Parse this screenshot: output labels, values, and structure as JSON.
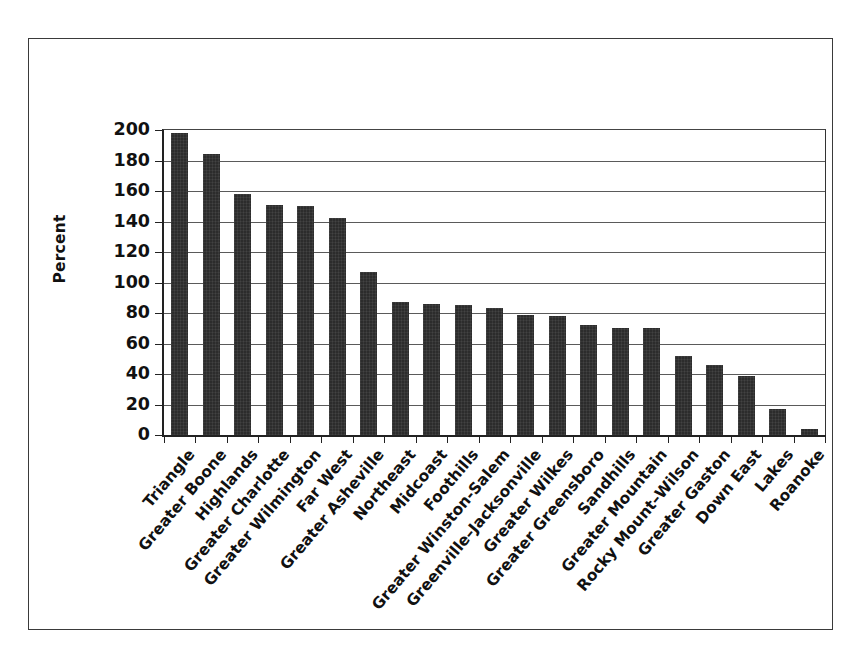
{
  "chart_data": {
    "type": "bar",
    "title": "",
    "subtitle": "",
    "xlabel": "",
    "ylabel": "Percent",
    "ylim": [
      0,
      200
    ],
    "ytick_step": 20,
    "yticks": [
      "200",
      "180",
      "160",
      "140",
      "120",
      "100",
      "80",
      "60",
      "40",
      "20",
      "0"
    ],
    "grid": "horizontal",
    "legend": "none",
    "bar_color": "#2c2c2c",
    "frame_color": "#3a3a3a",
    "categories": [
      "Triangle",
      "Greater Boone",
      "Highlands",
      "Greater Charlotte",
      "Greater Wilmington",
      "Far West",
      "Greater Asheville",
      "Northeast",
      "Midcoast",
      "Foothills",
      "Greater Winston-Salem",
      "Greenville–Jacksonville",
      "Greater Wilkes",
      "Greater Greensboro",
      "Sandhills",
      "Greater Mountain",
      "Rocky Mount–Wilson",
      "Greater Gaston",
      "Down East",
      "Lakes",
      "Roanoke"
    ],
    "values": [
      198,
      184,
      158,
      151,
      150,
      142,
      107,
      87,
      86,
      85,
      83,
      79,
      78,
      72,
      70,
      70,
      52,
      46,
      39,
      17,
      4
    ]
  }
}
